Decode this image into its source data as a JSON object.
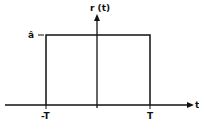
{
  "diagram": {
    "function_label": "r (t)",
    "amplitude_label": "â",
    "axis_label": "t",
    "ticks": [
      {
        "label": "-T",
        "position": "left edge of pulse"
      },
      {
        "label": "T",
        "position": "right edge of pulse"
      }
    ],
    "shape": "rectangular pulse",
    "line_color": "#111111",
    "background": "#ffffff"
  }
}
